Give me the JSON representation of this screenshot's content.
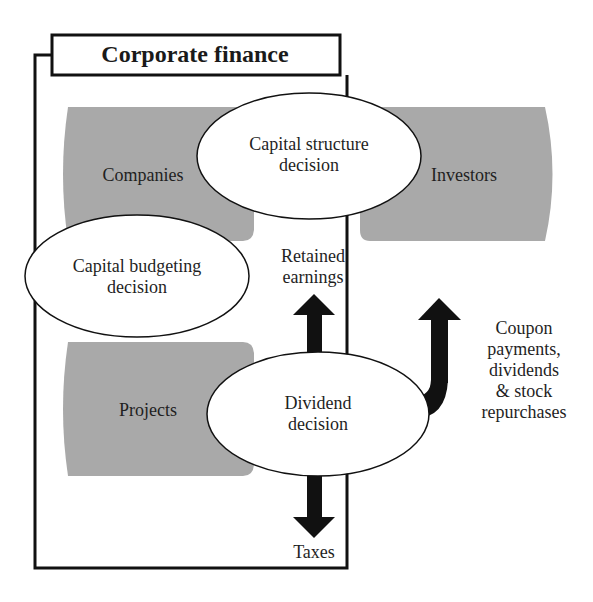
{
  "diagram": {
    "title": "Corporate finance",
    "entities": {
      "companies": "Companies",
      "investors": "Investors",
      "projects": "Projects"
    },
    "decisions": {
      "capital_structure": [
        "Capital structure",
        "decision"
      ],
      "capital_budgeting": [
        "Capital budgeting",
        "decision"
      ],
      "dividend": [
        "Dividend",
        "decision"
      ]
    },
    "flows": {
      "retained_earnings": [
        "Retained",
        "earnings"
      ],
      "payouts": [
        "Coupon",
        "payments,",
        "dividends",
        "& stock",
        "repurchases"
      ],
      "taxes": "Taxes"
    },
    "colors": {
      "entity_fill": "#a9a9a9",
      "ellipse_fill": "#ffffff",
      "stroke": "#111111",
      "arrow": "#111111"
    }
  }
}
